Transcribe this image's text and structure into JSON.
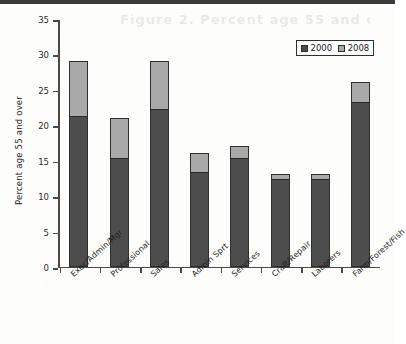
{
  "page": {
    "faded_header_text": "Figure 2. Percent age 55 and over"
  },
  "legend": {
    "position": "top-right",
    "items": [
      {
        "label": "2000",
        "color": "#4d4d4d"
      },
      {
        "label": "2008",
        "color": "#a9a9a9"
      }
    ]
  },
  "axes": {
    "y_title": "Percent age 55 and over",
    "y_ticks": [
      "0",
      "5",
      "10",
      "15",
      "20",
      "25",
      "30",
      "35"
    ],
    "x_title": ""
  },
  "chart_data": {
    "type": "bar",
    "title": "",
    "subtitle": "",
    "xlabel": "",
    "ylabel": "Percent age 55 and over",
    "ylim": [
      0,
      35
    ],
    "ytick_step": 5,
    "grid": false,
    "legend_position": "top-right",
    "bar_style": "overlaid-stacked",
    "categories": [
      "Exec/Admin/Mgr",
      "Professional",
      "Sales",
      "Admin Sprt",
      "Services",
      "Craft/Repair",
      "Laborers",
      "Farm/Forest/Fish"
    ],
    "series": [
      {
        "name": "2000",
        "color": "#4d4d4d",
        "values": [
          21,
          15,
          22,
          13,
          15,
          12,
          12,
          23
        ]
      },
      {
        "name": "2008",
        "color": "#a9a9a9",
        "values": [
          29,
          21,
          29,
          16,
          17,
          13,
          13,
          26
        ]
      }
    ]
  }
}
